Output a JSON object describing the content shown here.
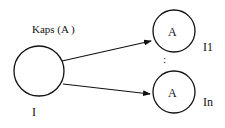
{
  "diagram": {
    "title_label": "Kaps (A )",
    "source_node": {
      "label": "I",
      "inner": ""
    },
    "target_nodes": [
      {
        "inner": "A",
        "label": "I1"
      },
      {
        "inner": "A",
        "label": "In"
      }
    ],
    "ellipsis": ":",
    "colors": {
      "stroke": "#111111",
      "background": "#ffffff"
    }
  }
}
